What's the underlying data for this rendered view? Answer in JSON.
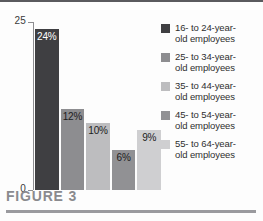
{
  "caption": "FIGURE 3",
  "chart_data": {
    "type": "bar",
    "title": "FIGURE 3",
    "xlabel": "",
    "ylabel": "",
    "ylim": [
      0,
      25
    ],
    "ytick_labels": [
      "25",
      "0"
    ],
    "grid": false,
    "legend_position": "right",
    "categories": [
      "16- to 24-year-old employees",
      "25- to 34-year-old employees",
      "35- to 44-year-old employees",
      "45- to 54-year-old employees",
      "55- to 64-year-old employees"
    ],
    "values": [
      24,
      12,
      10,
      6,
      9
    ],
    "value_labels": [
      "24%",
      "12%",
      "10%",
      "6%",
      "9%"
    ],
    "bar_colors": [
      "#3f3f42",
      "#8d8d90",
      "#bdbdbf",
      "#919194",
      "#cfcfd1"
    ],
    "value_label_colors": [
      "#ffffff",
      "#1c1c1c",
      "#1c1c1c",
      "#1c1c1c",
      "#1c1c1c"
    ]
  },
  "legend": {
    "items": [
      {
        "label_line1": "16- to 24-year-",
        "label_line2": "old employees",
        "color": "#3f3f42"
      },
      {
        "label_line1": "25- to 34-year-",
        "label_line2": "old employees",
        "color": "#8d8d90"
      },
      {
        "label_line1": "35- to 44-year-",
        "label_line2": "old employees",
        "color": "#bdbdbf"
      },
      {
        "label_line1": "45- to 54-year-",
        "label_line2": "old employees",
        "color": "#919194"
      },
      {
        "label_line1": "55- to 64-year-",
        "label_line2": "old employees",
        "color": "#cfcfd1"
      }
    ]
  }
}
